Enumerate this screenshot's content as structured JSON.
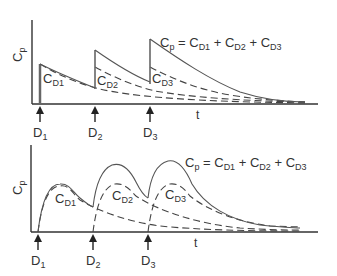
{
  "top_panel": {
    "ylabel": "Cp",
    "ylabel_main": "C",
    "ylabel_sub": "p",
    "xlabel": "t",
    "equation": {
      "lhs_main": "C",
      "lhs_sub": "p",
      "eq": " = ",
      "t1_main": "C",
      "t1_sub": "D1",
      "plus": " + ",
      "t2_main": "C",
      "t2_sub": "D2",
      "t3_main": "C",
      "t3_sub": "D3"
    },
    "curve_labels": [
      {
        "main": "C",
        "sub": "D1"
      },
      {
        "main": "C",
        "sub": "D2"
      },
      {
        "main": "C",
        "sub": "D3"
      }
    ],
    "doses": [
      {
        "main": "D",
        "sub": "1"
      },
      {
        "main": "D",
        "sub": "2"
      },
      {
        "main": "D",
        "sub": "3"
      }
    ],
    "description": "IV bolus: instantaneous rise at each dose, exponential decay; dashed component curves CD1, CD2, CD3 sum to Cp"
  },
  "bottom_panel": {
    "ylabel_main": "C",
    "ylabel_sub": "p",
    "xlabel": "t",
    "equation": {
      "lhs_main": "C",
      "lhs_sub": "p",
      "eq": " = ",
      "t1_main": "C",
      "t1_sub": "D1",
      "plus": " + ",
      "t2_main": "C",
      "t2_sub": "D2",
      "t3_main": "C",
      "t3_sub": "D3"
    },
    "curve_labels": [
      {
        "main": "C",
        "sub": "D1"
      },
      {
        "main": "C",
        "sub": "D2"
      },
      {
        "main": "C",
        "sub": "D3"
      }
    ],
    "doses": [
      {
        "main": "D",
        "sub": "1"
      },
      {
        "main": "D",
        "sub": "2"
      },
      {
        "main": "D",
        "sub": "3"
      }
    ],
    "description": "Oral/extravascular dosing: absorption rise then decline; dashed component curves sum to Cp"
  }
}
